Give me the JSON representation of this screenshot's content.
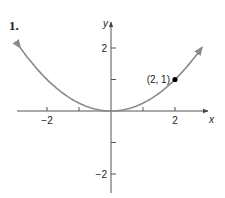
{
  "problem": {
    "number": "1."
  },
  "chart_data": {
    "type": "line",
    "title": "",
    "xlabel": "x",
    "ylabel": "y",
    "xlim": [
      -3,
      3
    ],
    "ylim": [
      -2.6,
      2.7
    ],
    "grid": false,
    "x_ticks": [
      -2,
      -1,
      1,
      2
    ],
    "x_tick_labels": [
      "-2",
      "",
      "",
      "2"
    ],
    "y_ticks": [
      -2,
      -1,
      1,
      2
    ],
    "y_tick_labels": [
      "-2",
      "",
      "",
      "2"
    ],
    "series": [
      {
        "name": "y = x^2/4",
        "color": "#8a8a8a",
        "x_range": [
          -2.84,
          2.84
        ],
        "arrows": "both",
        "x": [
          -2.8,
          -2.4,
          -2,
          -1.6,
          -1.2,
          -0.8,
          -0.4,
          0,
          0.4,
          0.8,
          1.2,
          1.6,
          2,
          2.4,
          2.8
        ],
        "y": [
          1.96,
          1.44,
          1.0,
          0.64,
          0.36,
          0.16,
          0.04,
          0,
          0.04,
          0.16,
          0.36,
          0.64,
          1.0,
          1.44,
          1.96
        ]
      }
    ],
    "points": [
      {
        "x": 2,
        "y": 1,
        "label": "(2, 1)",
        "color": "#000000"
      }
    ]
  },
  "colors": {
    "axis": "#555555",
    "curve": "#8a8a8a",
    "point": "#000000",
    "text": "#222222"
  }
}
